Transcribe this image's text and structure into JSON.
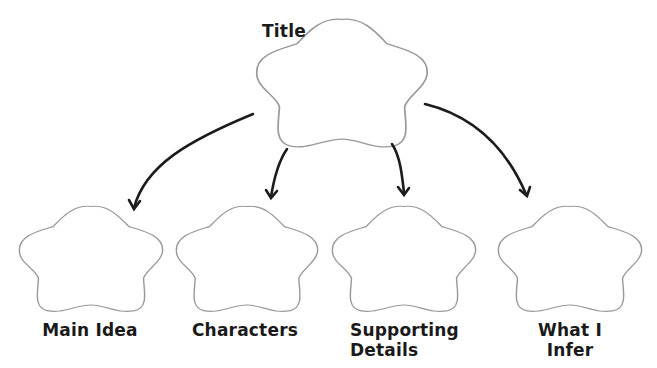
{
  "diagram": {
    "type": "graphic-organizer",
    "title_node": {
      "label": "Title"
    },
    "child_nodes": [
      {
        "label": "Main Idea"
      },
      {
        "label": "Characters"
      },
      {
        "label": "Supporting Details"
      },
      {
        "label": "What I Infer"
      }
    ],
    "edges": [
      {
        "from": "Title",
        "to": "Main Idea"
      },
      {
        "from": "Title",
        "to": "Characters"
      },
      {
        "from": "Title",
        "to": "Supporting Details"
      },
      {
        "from": "Title",
        "to": "What I Infer"
      }
    ],
    "colors": {
      "outline": "#9a9a9a",
      "arrow": "#1c1c1c",
      "text": "#1a1a1a"
    }
  },
  "labels": {
    "title": "Title",
    "main_idea": "Main Idea",
    "characters": "Characters",
    "supporting_line1": "Supporting",
    "supporting_line2": "Details",
    "infer_line1": "What I",
    "infer_line2": "Infer"
  }
}
